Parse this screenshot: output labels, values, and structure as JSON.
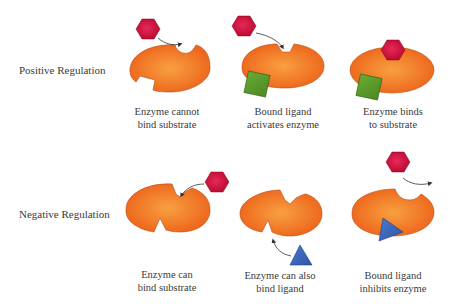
{
  "rows": [
    {
      "label": "Positive Regulation",
      "panels": [
        {
          "caption_line1": "Enzyme cannot",
          "caption_line2": "bind substrate"
        },
        {
          "caption_line1": "Bound ligand",
          "caption_line2": "activates enzyme"
        },
        {
          "caption_line1": "Enzyme binds",
          "caption_line2": "to substrate"
        }
      ]
    },
    {
      "label": "Negative Regulation",
      "panels": [
        {
          "caption_line1": "Enzyme can",
          "caption_line2": "bind substrate"
        },
        {
          "caption_line1": "Enzyme can also",
          "caption_line2": "bind ligand"
        },
        {
          "caption_line1": "Bound ligand",
          "caption_line2": "inhibits enzyme"
        }
      ]
    }
  ],
  "colors": {
    "enzyme": "#f06a1e",
    "enzyme_center": "#f8a040",
    "enzyme_edge": "#b84a10",
    "substrate": "#d0103a",
    "activator": "#5a9a2a",
    "inhibitor": "#3c66b8",
    "arrow": "#333333"
  }
}
